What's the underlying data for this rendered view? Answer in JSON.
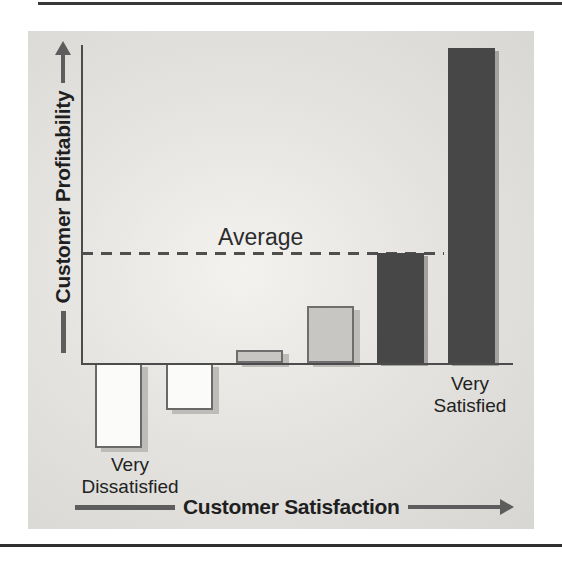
{
  "labels": {
    "average": "Average",
    "x_axis": "Customer Satisfaction",
    "y_axis": "Customer Profitability",
    "very_dissatisfied_line1": "Very",
    "very_dissatisfied_line2": "Dissatisfied",
    "very_satisfied_line1": "Very",
    "very_satisfied_line2": "Satisfied"
  },
  "chart_data": {
    "type": "bar",
    "title": "",
    "xlabel": "Customer Satisfaction",
    "ylabel": "Customer Profitability",
    "ylim": [
      -30,
      100
    ],
    "grid": false,
    "axis_tick_labels_visible": [
      "Very Dissatisfied",
      "Very Satisfied"
    ],
    "annotations": [
      {
        "label": "Average",
        "type": "horizontal-dashed-line",
        "y": 35
      }
    ],
    "average": 35,
    "bars": [
      {
        "category": "Very Dissatisfied",
        "value": -27,
        "fill": "white"
      },
      {
        "category": "",
        "value": -15,
        "fill": "white"
      },
      {
        "category": "",
        "value": 4,
        "fill": "light"
      },
      {
        "category": "",
        "value": 18,
        "fill": "light"
      },
      {
        "category": "",
        "value": 35,
        "fill": "dark"
      },
      {
        "category": "Very Satisfied",
        "value": 100,
        "fill": "dark"
      }
    ]
  },
  "colors": {
    "dark_bar": "#474747",
    "light_bar": "#c7c6c3",
    "white_bar": "#fbfbfa",
    "bar_border": "#6e6e6e",
    "bar_shadow": "#bdbcb9",
    "axis_line": "#4c4c4c",
    "dashed_line": "#4f4f4f",
    "arrow": "#5d5d5d",
    "text": "#262626",
    "panel_background": "#e4e3e0"
  }
}
